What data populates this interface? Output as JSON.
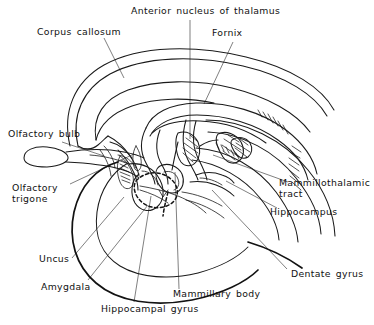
{
  "figure": {
    "background_color": "#ffffff",
    "ink_color": "#1a1a1a",
    "width": 374,
    "height": 325
  },
  "labels": {
    "anterior_nucleus_of_thalamus": "Anterior nucleus of thalamus",
    "fornix": "Fornix",
    "corpus_callosum": "Corpus callosum",
    "olfactory_bulb": "Olfactory bulb",
    "olfactory_trigone_line1": "Olfactory",
    "olfactory_trigone_line2": "trigone",
    "uncus": "Uncus",
    "amygdala": "Amygdala",
    "hippocampal_gyrus": "Hippocampal gyrus",
    "mammillary_body": "Mammillary body",
    "dentate_gyrus": "Dentate gyrus",
    "hippocampus": "Hippocampus",
    "mammillothalamic_tract_line1": "Mammillothalamic",
    "mammillothalamic_tract_line2": "tract"
  }
}
